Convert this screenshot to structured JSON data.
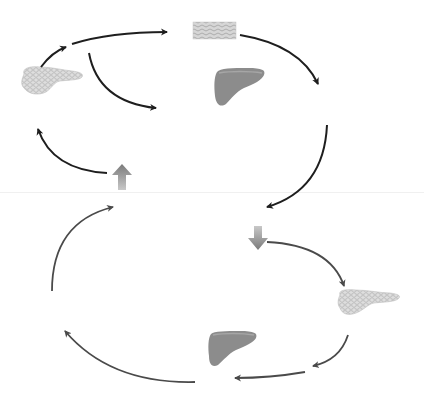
{
  "diagram": {
    "type": "cycle-diagram",
    "colors": {
      "background": "#ffffff",
      "top_arrow": "#1e1e1e",
      "bottom_arrow": "#4a4a4a",
      "block_arrow": "#8a8a8a",
      "organ_liver": "#8c8c8c",
      "organ_pancreas": "#d2d2d2",
      "tissue": "#c4c4c4",
      "divider": "#f0f0f0"
    },
    "top_cycle": {
      "organs": [
        {
          "id": "pancreas",
          "label": "",
          "icon": "pancreas-icon"
        },
        {
          "id": "tissue",
          "label": "",
          "icon": "tissue-cells-icon"
        },
        {
          "id": "liver",
          "label": "",
          "icon": "liver-icon"
        }
      ],
      "stimulus_arrow": {
        "direction": "up",
        "icon": "block-arrow-up-icon"
      }
    },
    "bottom_cycle": {
      "organs": [
        {
          "id": "pancreas",
          "label": "",
          "icon": "pancreas-icon"
        },
        {
          "id": "liver",
          "label": "",
          "icon": "liver-icon"
        }
      ],
      "stimulus_arrow": {
        "direction": "down",
        "icon": "block-arrow-down-icon"
      }
    }
  }
}
